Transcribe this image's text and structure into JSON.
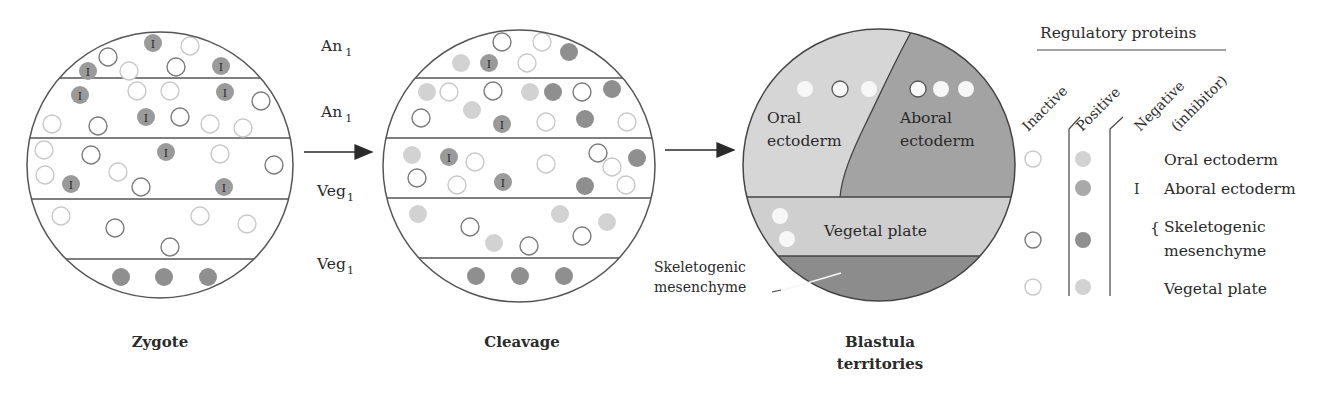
{
  "colors": {
    "outline": "#555555",
    "inactive_stroke": "#7a7a7a",
    "inactive_faint_stroke": "#c8c8c8",
    "positive_light": "#d2d2d2",
    "positive_mid": "#a9a9a9",
    "positive_dark": "#8f8f8f",
    "inhibitor_fill": "#9a9a9a",
    "oral_region": "#d6d6d6",
    "aboral_region": "#a3a3a3",
    "vegetal_region": "#cfcfcf",
    "skeletogenic_region": "#8c8c8c"
  },
  "band_labels": [
    {
      "base": "An",
      "sub": "1"
    },
    {
      "base": "An",
      "sub": "1"
    },
    {
      "base": "Veg",
      "sub": "1"
    },
    {
      "base": "Veg",
      "sub": "1"
    }
  ],
  "stages": {
    "zygote": {
      "label": "Zygote"
    },
    "cleavage": {
      "label": "Cleavage"
    },
    "blastula": {
      "label_line1": "Blastula",
      "label_line2": "territories"
    }
  },
  "blastula_regions": {
    "oral": {
      "line1": "Oral",
      "line2": "ectoderm"
    },
    "aboral": {
      "line1": "Aboral",
      "line2": "ectoderm"
    },
    "vegetal": {
      "label": "Vegetal plate"
    },
    "skeletogenic": {
      "line1": "Skeletogenic",
      "line2": "mesenchyme"
    }
  },
  "legend": {
    "title": "Regulatory proteins",
    "columns": [
      "Inactive",
      "Positive",
      "Negative",
      "(inhibitor)"
    ],
    "rows": [
      {
        "label": "Oral ectoderm",
        "inactive": "faint",
        "positive": "light",
        "negative": ""
      },
      {
        "label": "Aboral ectoderm",
        "inactive": "",
        "positive": "mid",
        "negative": "I"
      },
      {
        "label_line1": "Skeletogenic",
        "label_line2": "mesenchyme",
        "inactive": "dark",
        "positive": "dark",
        "negative": ""
      },
      {
        "label": "Vegetal plate",
        "inactive": "faint",
        "positive": "light",
        "negative": ""
      }
    ]
  },
  "zygote_cells": [
    {
      "x": 153,
      "y": 43,
      "t": "I"
    },
    {
      "x": 190,
      "y": 46,
      "t": "f"
    },
    {
      "x": 108,
      "y": 57,
      "t": "o"
    },
    {
      "x": 88,
      "y": 71,
      "t": "I"
    },
    {
      "x": 129,
      "y": 71,
      "t": "f"
    },
    {
      "x": 176,
      "y": 67,
      "t": "o"
    },
    {
      "x": 221,
      "y": 66,
      "t": "I"
    },
    {
      "x": 80,
      "y": 95,
      "t": "I"
    },
    {
      "x": 137,
      "y": 91,
      "t": "f"
    },
    {
      "x": 170,
      "y": 91,
      "t": "f"
    },
    {
      "x": 225,
      "y": 92,
      "t": "I"
    },
    {
      "x": 261,
      "y": 101,
      "t": "o"
    },
    {
      "x": 52,
      "y": 124,
      "t": "f"
    },
    {
      "x": 98,
      "y": 126,
      "t": "o"
    },
    {
      "x": 146,
      "y": 117,
      "t": "I"
    },
    {
      "x": 180,
      "y": 117,
      "t": "o"
    },
    {
      "x": 210,
      "y": 124,
      "t": "f"
    },
    {
      "x": 243,
      "y": 128,
      "t": "f"
    },
    {
      "x": 44,
      "y": 150,
      "t": "f"
    },
    {
      "x": 91,
      "y": 155,
      "t": "o"
    },
    {
      "x": 166,
      "y": 152,
      "t": "I"
    },
    {
      "x": 220,
      "y": 154,
      "t": "f"
    },
    {
      "x": 274,
      "y": 165,
      "t": "o"
    },
    {
      "x": 45,
      "y": 175,
      "t": "f"
    },
    {
      "x": 118,
      "y": 172,
      "t": "f"
    },
    {
      "x": 71,
      "y": 184,
      "t": "I"
    },
    {
      "x": 141,
      "y": 187,
      "t": "o"
    },
    {
      "x": 224,
      "y": 187,
      "t": "I"
    },
    {
      "x": 61,
      "y": 216,
      "t": "f"
    },
    {
      "x": 200,
      "y": 216,
      "t": "f"
    },
    {
      "x": 247,
      "y": 224,
      "t": "f"
    },
    {
      "x": 115,
      "y": 228,
      "t": "o"
    },
    {
      "x": 170,
      "y": 247,
      "t": "o"
    },
    {
      "x": 121,
      "y": 277,
      "t": "D"
    },
    {
      "x": 164,
      "y": 277,
      "t": "D"
    },
    {
      "x": 208,
      "y": 277,
      "t": "D"
    }
  ],
  "cleavage_cells": [
    {
      "x": 502,
      "y": 42,
      "t": "o"
    },
    {
      "x": 542,
      "y": 42,
      "t": "f"
    },
    {
      "x": 569,
      "y": 52,
      "t": "D"
    },
    {
      "x": 461,
      "y": 63,
      "t": "L"
    },
    {
      "x": 489,
      "y": 63,
      "t": "I"
    },
    {
      "x": 527,
      "y": 63,
      "t": "f"
    },
    {
      "x": 427,
      "y": 92,
      "t": "L"
    },
    {
      "x": 449,
      "y": 92,
      "t": "f"
    },
    {
      "x": 493,
      "y": 91,
      "t": "o"
    },
    {
      "x": 530,
      "y": 92,
      "t": "L"
    },
    {
      "x": 553,
      "y": 92,
      "t": "D"
    },
    {
      "x": 582,
      "y": 92,
      "t": "o"
    },
    {
      "x": 612,
      "y": 89,
      "t": "D"
    },
    {
      "x": 421,
      "y": 118,
      "t": "o"
    },
    {
      "x": 472,
      "y": 110,
      "t": "L"
    },
    {
      "x": 502,
      "y": 124,
      "t": "I"
    },
    {
      "x": 546,
      "y": 122,
      "t": "f"
    },
    {
      "x": 585,
      "y": 119,
      "t": "D"
    },
    {
      "x": 627,
      "y": 122,
      "t": "f"
    },
    {
      "x": 412,
      "y": 155,
      "t": "L"
    },
    {
      "x": 449,
      "y": 157,
      "t": "I"
    },
    {
      "x": 475,
      "y": 162,
      "t": "f"
    },
    {
      "x": 546,
      "y": 164,
      "t": "f"
    },
    {
      "x": 598,
      "y": 153,
      "t": "o"
    },
    {
      "x": 612,
      "y": 167,
      "t": "f"
    },
    {
      "x": 637,
      "y": 158,
      "t": "D"
    },
    {
      "x": 417,
      "y": 178,
      "t": "o"
    },
    {
      "x": 457,
      "y": 185,
      "t": "f"
    },
    {
      "x": 503,
      "y": 182,
      "t": "I"
    },
    {
      "x": 585,
      "y": 186,
      "t": "D"
    },
    {
      "x": 626,
      "y": 185,
      "t": "f"
    },
    {
      "x": 418,
      "y": 214,
      "t": "L"
    },
    {
      "x": 560,
      "y": 214,
      "t": "L"
    },
    {
      "x": 607,
      "y": 222,
      "t": "L"
    },
    {
      "x": 470,
      "y": 227,
      "t": "o"
    },
    {
      "x": 582,
      "y": 236,
      "t": "o"
    },
    {
      "x": 494,
      "y": 243,
      "t": "L"
    },
    {
      "x": 529,
      "y": 246,
      "t": "o"
    },
    {
      "x": 476,
      "y": 276,
      "t": "D"
    },
    {
      "x": 520,
      "y": 276,
      "t": "D"
    },
    {
      "x": 564,
      "y": 276,
      "t": "D"
    }
  ],
  "blastula_cells": [
    {
      "x": 805,
      "y": 89,
      "t": "w"
    },
    {
      "x": 840,
      "y": 89,
      "t": "wo"
    },
    {
      "x": 869,
      "y": 89,
      "t": "w"
    },
    {
      "x": 918,
      "y": 89,
      "t": "wo"
    },
    {
      "x": 941,
      "y": 89,
      "t": "w"
    },
    {
      "x": 966,
      "y": 89,
      "t": "w"
    },
    {
      "x": 780,
      "y": 216,
      "t": "w"
    },
    {
      "x": 787,
      "y": 239,
      "t": "w"
    }
  ]
}
